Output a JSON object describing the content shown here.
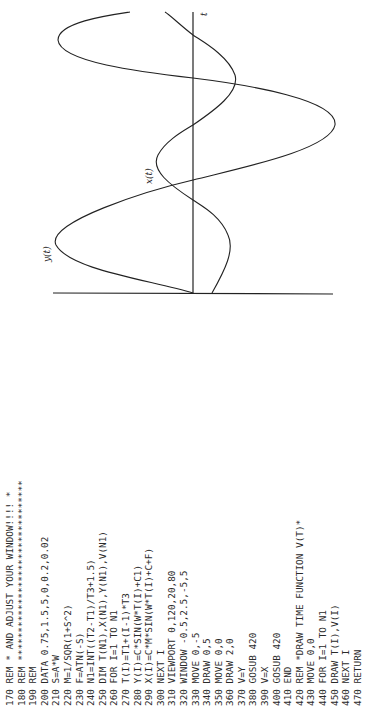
{
  "listing": {
    "partial_top_line": "REM * AND ADJUST YOUR WINDOW!!!! *",
    "lines": [
      {
        "num": "170",
        "text": "REM * AND ADJUST YOUR WINDOW!!!! *"
      },
      {
        "num": "180",
        "text": "REM ********************************"
      },
      {
        "num": "190",
        "text": "REM"
      },
      {
        "num": "200",
        "text": "DATA 0.75,1.5,5,0,0.2,0.02"
      },
      {
        "num": "210",
        "text": "S=A*W"
      },
      {
        "num": "220",
        "text": "M=1/SQR(1+S^2)"
      },
      {
        "num": "230",
        "text": "F=ATN(-S)"
      },
      {
        "num": "240",
        "text": "N1=INT((T2-T1)/T3+1.5)"
      },
      {
        "num": "250",
        "text": "DIM T(N1),X(N1),Y(N1),V(N1)"
      },
      {
        "num": "260",
        "text": "FOR I=1 TO N1"
      },
      {
        "num": "270",
        "text": "T(I)=T1+(I-1)*T3"
      },
      {
        "num": "280",
        "text": "Y(I)=C*SIN(W*T(I)+C1)"
      },
      {
        "num": "290",
        "text": "X(I)=C*M*SIN(W*T(I)+C+F)"
      },
      {
        "num": "300",
        "text": "NEXT I"
      },
      {
        "num": "310",
        "text": "VIEWPORT 0,120,20,80"
      },
      {
        "num": "320",
        "text": "WINDOW -0.5,2.5,-5,5"
      },
      {
        "num": "330",
        "text": "MOVE 0,-5"
      },
      {
        "num": "340",
        "text": "DRAW 0,5"
      },
      {
        "num": "350",
        "text": "MOVE 0,0"
      },
      {
        "num": "360",
        "text": "DRAW 2,0"
      },
      {
        "num": "370",
        "text": "V=Y"
      },
      {
        "num": "380",
        "text": "GOSUB 420"
      },
      {
        "num": "390",
        "text": "V=X"
      },
      {
        "num": "400",
        "text": "GOSUB 420"
      },
      {
        "num": "410",
        "text": "END"
      },
      {
        "num": "420",
        "text": "REM *DRAW TIME FUNCTION V(T)*"
      },
      {
        "num": "430",
        "text": "MOVE 0,0"
      },
      {
        "num": "440",
        "text": "FOR I=1 TO N1"
      },
      {
        "num": "450",
        "text": "DRAW T(I),V(I)"
      },
      {
        "num": "460",
        "text": "NEXT I"
      },
      {
        "num": "470",
        "text": "RETURN"
      }
    ]
  },
  "figure": {
    "axis_label_t": "t",
    "curve_label_x": "x(t)",
    "curve_label_y": "y(t)"
  }
}
